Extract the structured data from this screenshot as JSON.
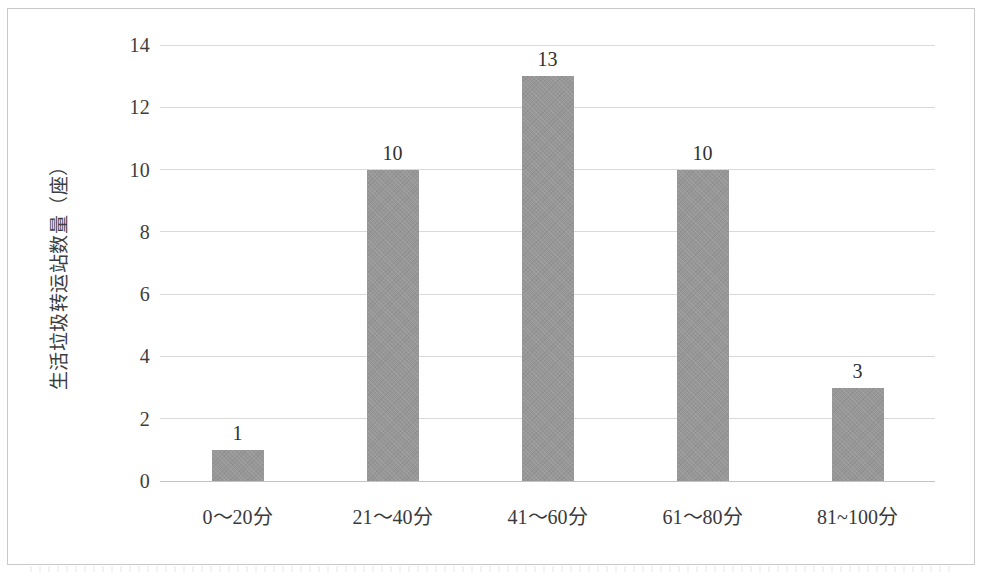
{
  "chart_data": {
    "type": "bar",
    "title": "",
    "subtitle": "",
    "xlabel": "",
    "ylabel": "生活垃圾转运站数量（座）",
    "categories": [
      "0～20分",
      "21～40分",
      "41～60分",
      "61～80分",
      "81~100分"
    ],
    "values": [
      1,
      10,
      13,
      10,
      3
    ],
    "value_labels": [
      "1",
      "10",
      "13",
      "10",
      "3"
    ],
    "series": [
      {
        "name": "生活垃圾转运站数量",
        "values": [
          1,
          10,
          13,
          10,
          3
        ]
      }
    ],
    "ylim": [
      0,
      14
    ],
    "ytick_values": [
      0,
      2,
      4,
      6,
      8,
      10,
      12,
      14
    ],
    "ytick_labels": [
      "0",
      "2",
      "4",
      "6",
      "8",
      "10",
      "12",
      "14"
    ],
    "grid": true,
    "grid_axis": "y",
    "legend": false,
    "legend_position": "none",
    "bar_color": "#979797",
    "gridline_color": "#d9d9d9",
    "axis_color": "#c2c2c2",
    "frame_color": "#c9c9c9",
    "text_color": "#3a3a3a",
    "annotations": []
  }
}
